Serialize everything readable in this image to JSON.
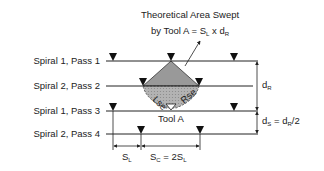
{
  "title": {
    "line1": "Theoretical Area Swept",
    "line2_prefix": "by Tool A = S",
    "line2_sub1": "L",
    "line2_mid": " x d",
    "line2_sub2": "R"
  },
  "passes": [
    {
      "label": "Spiral 1, Pass 1"
    },
    {
      "label": "Spiral 2, Pass 2"
    },
    {
      "label": "Spiral 1, Pass 3"
    },
    {
      "label": "Spiral 2, Pass 4"
    }
  ],
  "tool_label": "Tool A",
  "edge_labels": {
    "left": "Lse",
    "right": "Rse"
  },
  "dims": {
    "dR": {
      "main": "d",
      "sub": "R"
    },
    "dS": {
      "main": "d",
      "sub": "S",
      "eq": " = d",
      "sub2": "R",
      "tail": "/2"
    },
    "SL": {
      "main": "S",
      "sub": "L"
    },
    "SC": {
      "main": "S",
      "sub": "C",
      "eq": " = 2S",
      "sub2": "L"
    }
  },
  "colors": {
    "line": "#222222",
    "fill": "#a6a6a6"
  }
}
